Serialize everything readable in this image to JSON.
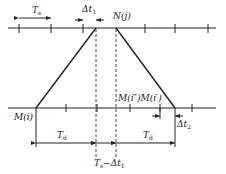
{
  "diagram": {
    "labels": {
      "ts": "T",
      "ts_sub": "s",
      "dt1_prefix": "Δt",
      "dt1_sub": "1",
      "nj": "N(j)",
      "mi": "M(i)",
      "mi2": "M(i″)M(i′)",
      "dt2_prefix": "Δt",
      "dt2_sub": "2",
      "td_left": "T",
      "td_left_sub": "d",
      "td_right": "T",
      "td_right_sub": "d",
      "ts_minus_dt1_a": "T",
      "ts_minus_dt1_sub_a": "s",
      "ts_minus_dt1_b": "−Δt",
      "ts_minus_dt1_sub_b": "1"
    },
    "top_axis": {
      "y": 28,
      "ticks": [
        19,
        51,
        83,
        145,
        175,
        208
      ]
    },
    "bottom_axis": {
      "y": 108,
      "ticks": [
        66,
        97,
        130,
        160,
        192
      ]
    },
    "trapezoid": {
      "bottom_left": 36,
      "top_left": 96,
      "top_right": 116,
      "bottom_right": 175
    },
    "stroke_color": "#222222"
  }
}
